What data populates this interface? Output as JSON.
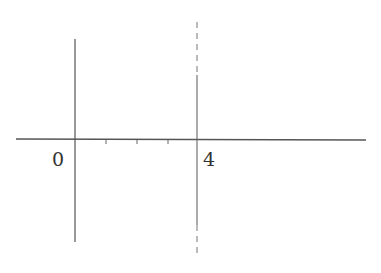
{
  "diagram": {
    "labels": {
      "origin": "0",
      "end": "4"
    },
    "ticks": [
      "1",
      "2",
      "3"
    ],
    "colors": {
      "line": "#555555",
      "text": "#333333"
    }
  }
}
